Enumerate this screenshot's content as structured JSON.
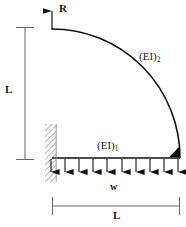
{
  "figure": {
    "labels": {
      "reaction": "R",
      "height_dim": "L",
      "span_dim": "L",
      "load": "w",
      "stiffness_straight_prefix": "(EI)",
      "stiffness_straight_sub": "1",
      "stiffness_curved_prefix": "(EI)",
      "stiffness_curved_sub": "2"
    },
    "colors": {
      "stroke": "#1a1a1a",
      "dimension": "#555555",
      "hatch": "#808080",
      "fill": "#000000",
      "background": "#ffffff"
    }
  },
  "geometry": {
    "origin": {
      "x": 52,
      "y": 158
    },
    "corner": {
      "x": 180,
      "y": 158
    },
    "apex": {
      "x": 52,
      "y": 29
    },
    "arc_radius_x": 128,
    "arc_radius_y": 129,
    "beam_y": 158,
    "support": {
      "x": 45,
      "y": 124,
      "width": 11,
      "height": 58
    },
    "gusset": {
      "x1": 170,
      "y1": 158,
      "x2": 180,
      "y2": 158,
      "x3": 180,
      "y3": 147
    },
    "reaction_arrow": {
      "x": 52,
      "y_tail": 30,
      "y_head": 2
    },
    "load_arrows_x": [
      51,
      65,
      79,
      93,
      107,
      122,
      136,
      150,
      164,
      179
    ],
    "load_arrow_top": 159,
    "load_arrow_bottom": 180,
    "dim_left": {
      "x": 25,
      "y_top": 27,
      "y_bottom": 160,
      "tick_half": 9
    },
    "dim_bottom": {
      "y": 206,
      "x_left": 52,
      "x_right": 180,
      "tick_half": 9
    }
  }
}
